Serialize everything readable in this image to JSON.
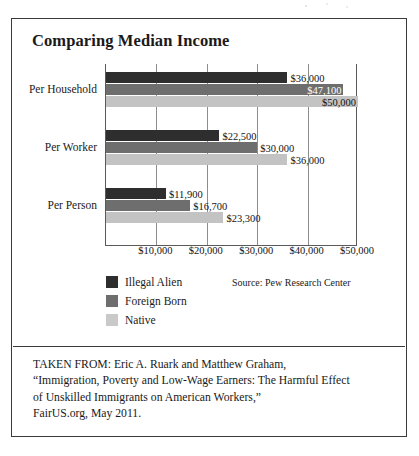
{
  "figure": {
    "title": "Comparing Median Income",
    "source_note": "Source: Pew Research Center",
    "attribution_lines": [
      "TAKEN FROM: Eric A. Ruark and Matthew Graham,",
      "“Immigration, Poverty and Low-Wage Earners: The Harmful Effect",
      "of Unskilled Immigrants on American Workers,”",
      "FairUS.org, May 2011."
    ]
  },
  "colors": {
    "series_illegal_alien": "#2e2e2e",
    "series_foreign_born": "#6e6e6e",
    "series_native": "#c3c3c3",
    "border": "#3a3a3a",
    "gridline": "#8d8d8d"
  },
  "chart_data": {
    "type": "bar",
    "orientation": "horizontal",
    "title": "Comparing Median Income",
    "xlabel": "",
    "ylabel": "",
    "categories": [
      "Per Household",
      "Per Worker",
      "Per Person"
    ],
    "series": [
      {
        "name": "Illegal Alien",
        "values": [
          36000,
          22500,
          11900
        ],
        "labels": [
          "$36,000",
          "$22,500",
          "$11,900"
        ]
      },
      {
        "name": "Foreign Born",
        "values": [
          47100,
          30000,
          16700
        ],
        "labels": [
          "$47,100",
          "$30,000",
          "$16,700"
        ]
      },
      {
        "name": "Native",
        "values": [
          50000,
          36000,
          23300
        ],
        "labels": [
          "$50,000",
          "$36,000",
          "$23,300"
        ]
      }
    ],
    "xlim": [
      0,
      50000
    ],
    "xticks": [
      10000,
      20000,
      30000,
      40000,
      50000
    ],
    "xticklabels": [
      "$10,000",
      "$20,000",
      "$30,000",
      "$40,000",
      "$50,000"
    ],
    "grid": true,
    "legend_position": "below-left",
    "annotations": [
      "Source: Pew Research Center"
    ]
  }
}
